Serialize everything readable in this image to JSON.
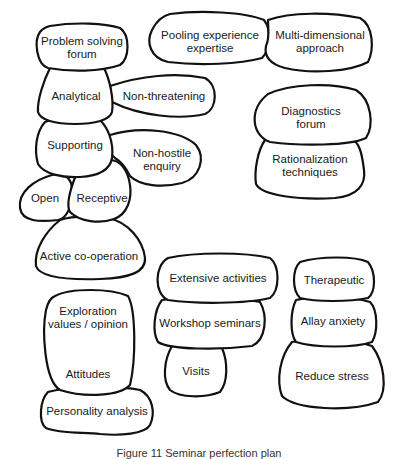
{
  "diagram": {
    "type": "bubble-cluster",
    "clusters": [
      {
        "id": "left-top",
        "nodes": [
          {
            "id": "problem-solving-forum",
            "label": "Problem solving\nforum",
            "lines": [
              "Problem solving",
              "forum"
            ]
          },
          {
            "id": "analytical",
            "label": "Analytical",
            "lines": [
              "Analytical"
            ]
          },
          {
            "id": "non-threatening",
            "label": "Non-threatening",
            "lines": [
              "Non-threatening"
            ]
          },
          {
            "id": "supporting",
            "label": "Supporting",
            "lines": [
              "Supporting"
            ]
          },
          {
            "id": "non-hostile-enquiry",
            "label": "Non-hostile\nenquiry",
            "lines": [
              "Non-hostile",
              "enquiry"
            ]
          },
          {
            "id": "open",
            "label": "Open",
            "lines": [
              "Open"
            ]
          },
          {
            "id": "receptive",
            "label": "Receptive",
            "lines": [
              "Receptive"
            ]
          },
          {
            "id": "active-co-operation",
            "label": "Active co-operation",
            "lines": [
              "Active co-operation"
            ]
          }
        ]
      },
      {
        "id": "top-right",
        "nodes": [
          {
            "id": "pooling-experience",
            "label": "Pooling experience\nexpertise",
            "lines": [
              "Pooling experience",
              "expertise"
            ]
          },
          {
            "id": "multi-dimensional",
            "label": "Multi-dimensional\napproach",
            "lines": [
              "Multi-dimensional",
              "approach"
            ]
          }
        ]
      },
      {
        "id": "right-middle",
        "nodes": [
          {
            "id": "diagnostics-forum",
            "label": "Diagnostics\nforum",
            "lines": [
              "Diagnostics",
              "forum"
            ]
          },
          {
            "id": "rationalization-techniques",
            "label": "Rationalization\ntechniques",
            "lines": [
              "Rationalization",
              "techniques"
            ]
          }
        ]
      },
      {
        "id": "center-bottom",
        "nodes": [
          {
            "id": "extensive-activities",
            "label": "Extensive activities",
            "lines": [
              "Extensive activities"
            ]
          },
          {
            "id": "workshop-seminars",
            "label": "Workshop seminars",
            "lines": [
              "Workshop seminars"
            ]
          },
          {
            "id": "visits",
            "label": "Visits",
            "lines": [
              "Visits"
            ]
          }
        ]
      },
      {
        "id": "right-bottom",
        "nodes": [
          {
            "id": "therapeutic",
            "label": "Therapeutic",
            "lines": [
              "Therapeutic"
            ]
          },
          {
            "id": "allay-anxiety",
            "label": "Allay anxiety",
            "lines": [
              "Allay anxiety"
            ]
          },
          {
            "id": "reduce-stress",
            "label": "Reduce stress",
            "lines": [
              "Reduce stress"
            ]
          }
        ]
      },
      {
        "id": "left-bottom",
        "nodes": [
          {
            "id": "exploration",
            "label": "Exploration\nvalues / opinion",
            "lines": [
              "Exploration",
              "values / opinion"
            ]
          },
          {
            "id": "attitudes",
            "label": "Attitudes",
            "lines": [
              "Attitudes"
            ]
          },
          {
            "id": "personality-analysis",
            "label": "Personality analysis",
            "lines": [
              "Personality analysis"
            ]
          }
        ]
      }
    ]
  },
  "labels": {
    "problem_solving_1": "Problem solving",
    "problem_solving_2": "forum",
    "analytical": "Analytical",
    "non_threatening": "Non-threatening",
    "supporting": "Supporting",
    "non_hostile_1": "Non-hostile",
    "non_hostile_2": "enquiry",
    "open": "Open",
    "receptive": "Receptive",
    "active_cooperation": "Active co-operation",
    "pooling_1": "Pooling experience",
    "pooling_2": "expertise",
    "multi_1": "Multi-dimensional",
    "multi_2": "approach",
    "diagnostics_1": "Diagnostics",
    "diagnostics_2": "forum",
    "rational_1": "Rationalization",
    "rational_2": "techniques",
    "extensive": "Extensive activities",
    "workshop": "Workshop seminars",
    "visits": "Visits",
    "therapeutic": "Therapeutic",
    "allay": "Allay anxiety",
    "reduce": "Reduce stress",
    "exploration_1": "Exploration",
    "exploration_2": "values / opinion",
    "attitudes": "Attitudes",
    "personality": "Personality analysis"
  },
  "caption": "Figure 11 Seminar perfection plan"
}
